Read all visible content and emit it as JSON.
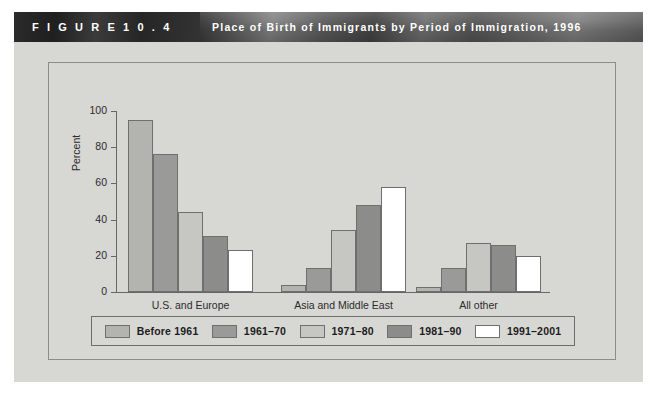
{
  "banner": {
    "figure_label": "F I G U R E   1 0 . 4",
    "title": "Place of Birth of Immigrants by Period of Immigration, 1996"
  },
  "chart_data": {
    "type": "bar",
    "title": "Place of Birth of Immigrants by Period of Immigration, 1996",
    "xlabel": "",
    "ylabel": "Percent",
    "ylim": [
      0,
      100
    ],
    "yticks": [
      0,
      20,
      40,
      60,
      80,
      100
    ],
    "ytick_labels": [
      "0",
      "20",
      "40",
      "60",
      "80",
      "100"
    ],
    "grid": false,
    "legend_position": "bottom",
    "categories": [
      "U.S. and Europe",
      "Asia and Middle East",
      "All other"
    ],
    "series": [
      {
        "name": "Before 1961",
        "color": "#b3b3b0",
        "values": [
          95,
          4,
          3
        ]
      },
      {
        "name": "1961–70",
        "color": "#9a9a98",
        "values": [
          76,
          13,
          13
        ]
      },
      {
        "name": "1971–80",
        "color": "#c6c6c3",
        "values": [
          44,
          34,
          27
        ]
      },
      {
        "name": "1981–90",
        "color": "#8c8c8a",
        "values": [
          31,
          48,
          26
        ]
      },
      {
        "name": "1991–2001",
        "color": "#ffffff",
        "values": [
          23,
          58,
          20
        ]
      }
    ]
  },
  "colors": {
    "page_background": "#ffffff",
    "panel_background": "#d7d7d4",
    "frame_border": "#8c8c8c",
    "axis": "#666666",
    "bar_outline": "#6f6f6f",
    "banner_text": "#ffffff",
    "text": "#2b2b2b"
  }
}
